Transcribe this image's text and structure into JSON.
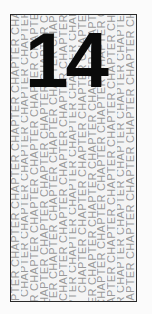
{
  "chapter": {
    "number": "14",
    "background_word": "CHAPTER",
    "repeat_text": "CHAPTER CHAPTER CHAPTER CHAPTER CHAPTER CHAPTER CHAPTER CHAPTER",
    "column_offsets": [
      "-34px",
      "-6px",
      "-58px",
      "-22px",
      "-46px",
      "-10px",
      "-40px",
      "-2px",
      "-52px",
      "-16px",
      "-30px",
      "-60px",
      "-26px"
    ]
  }
}
